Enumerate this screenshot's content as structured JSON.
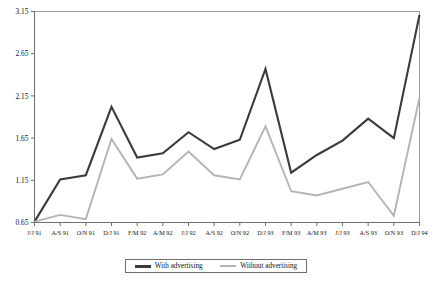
{
  "chart_data": {
    "type": "line",
    "title": "",
    "xlabel": "",
    "ylabel": "",
    "grid": false,
    "legend_position": "bottom-center",
    "ylim": [
      0.65,
      3.15
    ],
    "yticks": [
      "0.65",
      "1.15",
      "1.65",
      "2.15",
      "2.65",
      "3.15"
    ],
    "ytick_values": [
      0.65,
      1.15,
      1.65,
      2.15,
      2.65,
      3.15
    ],
    "categories": [
      "J/J 91",
      "A/S 91",
      "O/N 91",
      "D/J 91",
      "F/M 92",
      "A/M 92",
      "J/J 92",
      "A/S 92",
      "O/N 92",
      "D/J 93",
      "F/M 93",
      "A/M 93",
      "J/J 93",
      "A/S 93",
      "O/N 93",
      "D/J 94"
    ],
    "series": [
      {
        "name": "With advertising",
        "color": "#3b3b3b",
        "values": [
          0.66,
          1.16,
          1.21,
          2.02,
          1.42,
          1.47,
          1.72,
          1.52,
          1.63,
          2.47,
          1.24,
          1.45,
          1.62,
          1.88,
          1.65,
          3.11
        ]
      },
      {
        "name": "Without advertising",
        "color": "#b4b4b4",
        "values": [
          0.66,
          0.74,
          0.69,
          1.64,
          1.17,
          1.22,
          1.49,
          1.21,
          1.16,
          1.79,
          1.02,
          0.97,
          1.05,
          1.13,
          0.73,
          2.13
        ]
      }
    ]
  },
  "legend": {
    "items": [
      {
        "label": "With advertising"
      },
      {
        "label": "Without advertising"
      }
    ]
  },
  "caption": {
    "text": ""
  }
}
